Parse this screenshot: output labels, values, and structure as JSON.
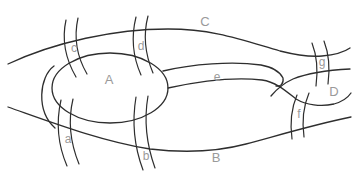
{
  "figure": {
    "region_labels": {
      "A": "A",
      "B": "B",
      "C": "C",
      "D": "D"
    },
    "curve_labels": {
      "a": "a",
      "b": "b",
      "c": "c",
      "d": "d",
      "e": "e",
      "f": "f",
      "g": "g"
    }
  },
  "colors": {
    "line": "#2e2e2e",
    "label": "#9a9a9a",
    "background": "#ffffff"
  }
}
